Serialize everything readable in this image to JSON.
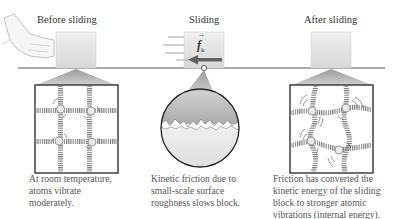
{
  "panels": [
    {
      "id": "before",
      "title": "Before sliding",
      "caption_lines": [
        "At room temperature,",
        "atoms vibrate",
        "moderately."
      ]
    },
    {
      "id": "during",
      "title": "Sliding",
      "force_label": "f",
      "force_subscript": "k",
      "caption_lines": [
        "Kinetic friction due to",
        "small-scale surface",
        "roughness slows block."
      ]
    },
    {
      "id": "after",
      "title": "After sliding",
      "caption_lines": [
        "Friction has converted the",
        "kinetic energy of the sliding",
        "block to stronger atomic",
        "vibrations (internal energy)."
      ]
    }
  ],
  "colors": {
    "block": "#e2e2e2",
    "surface_line": "#555555",
    "funnel": "#b8b8b8",
    "spring": "#8a8a8a",
    "arrow": "#606060"
  }
}
